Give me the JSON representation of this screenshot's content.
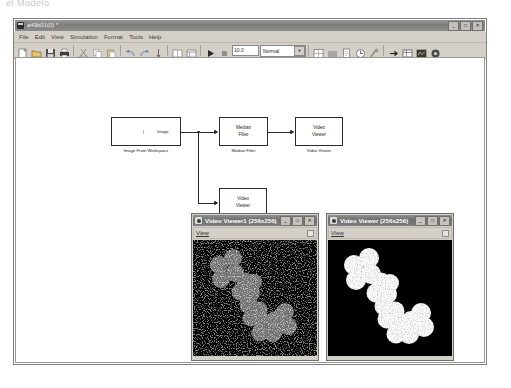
{
  "top_caption": "el Modelo",
  "app_window": {
    "title": "a49b01(0) *",
    "icon": "simulink-icon",
    "controls": {
      "minimize": "_",
      "maximize": "□",
      "close": "✕"
    },
    "menus": [
      "File",
      "Edit",
      "View",
      "Simulation",
      "Format",
      "Tools",
      "Help"
    ],
    "toolbar": {
      "buttons": [
        "new-model-icon",
        "open-model-icon",
        "save-model-icon",
        "print-icon",
        "cut-icon",
        "copy-icon",
        "paste-icon",
        "undo-icon",
        "redo-icon",
        "update-diagram-icon",
        "library-browser-icon",
        "model-explorer-icon",
        "start-simulation-icon",
        "stop-simulation-icon"
      ],
      "stop_time": "10.0",
      "sim_mode": "Normal",
      "right_buttons": [
        "debug-icon",
        "set-path-icon",
        "model-properties-icon",
        "profiler-icon",
        "build-icon",
        "go-to-parent-icon",
        "block-parameters-icon",
        "scope-icon",
        "help-icon"
      ]
    }
  },
  "diagram": {
    "blocks": [
      {
        "id": "image-from-workspace",
        "inner_label": "",
        "port_label": "Image",
        "caption": "Image From Workspace"
      },
      {
        "id": "median-filter",
        "inner_label": "Median\nFilter",
        "port_label": "",
        "caption": "Median Filter"
      },
      {
        "id": "video-viewer",
        "inner_label": "Video\nViewer",
        "port_label": "",
        "caption": "Video Viewer"
      },
      {
        "id": "video-viewer1",
        "inner_label": "Video\nViewer",
        "port_label": "",
        "caption": "Video Viewer1"
      }
    ]
  },
  "video_windows": [
    {
      "id": "video-viewer1-window",
      "title": "Video Viewer1 (256x256)",
      "menu": "View",
      "image_description": "noisy-blob-chain",
      "noisy": true,
      "controls": {
        "minimize": "_",
        "maximize": "□",
        "close": "✕"
      }
    },
    {
      "id": "video-viewer-window",
      "title": "Video Viewer (256x256)",
      "menu": "View",
      "image_description": "filtered-blob-chain",
      "noisy": false,
      "controls": {
        "minimize": "_",
        "maximize": "□",
        "close": "✕"
      }
    }
  ],
  "colors": {
    "window_face": "#d4d0c8",
    "titlebar": "#7d7d7d",
    "canvas": "#ffffff",
    "block_line": "#2b2b2b",
    "video_background": "#000000",
    "blob_fill": "#ffffff"
  }
}
